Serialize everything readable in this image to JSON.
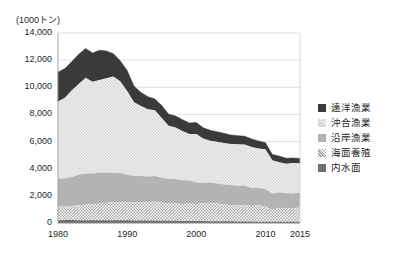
{
  "chart_data": {
    "type": "area",
    "title": "",
    "subtitle": "",
    "unit_label": "(1000トン)",
    "xlabel": "",
    "ylabel": "",
    "stacked": true,
    "grid": true,
    "legend_position": "right",
    "xlim": [
      1980,
      2015
    ],
    "ylim": [
      0,
      14000
    ],
    "ytick_labels": [
      "14,000",
      "12,000",
      "10,000",
      "8,000",
      "6,000",
      "4,000",
      "2,000",
      "0"
    ],
    "ytick_values": [
      14000,
      12000,
      10000,
      8000,
      6000,
      4000,
      2000,
      0
    ],
    "xtick_labels": [
      "1980",
      "1990",
      "2000",
      "2010",
      "2015"
    ],
    "xtick_values": [
      1980,
      1990,
      2000,
      2010,
      2015
    ],
    "x": [
      1980,
      1981,
      1982,
      1983,
      1984,
      1985,
      1986,
      1987,
      1988,
      1989,
      1990,
      1991,
      1992,
      1993,
      1994,
      1995,
      1996,
      1997,
      1998,
      1999,
      2000,
      2001,
      2002,
      2003,
      2004,
      2005,
      2006,
      2007,
      2008,
      2009,
      2010,
      2011,
      2012,
      2013,
      2014,
      2015
    ],
    "series": [
      {
        "name": "内水面",
        "pattern": "dark-gray-solid",
        "color": "#6b6b6b",
        "values": [
          210,
          215,
          215,
          210,
          205,
          205,
          205,
          205,
          200,
          200,
          200,
          190,
          185,
          180,
          175,
          170,
          165,
          160,
          155,
          150,
          145,
          140,
          135,
          130,
          125,
          120,
          115,
          110,
          105,
          100,
          95,
          90,
          90,
          90,
          90,
          90
        ]
      },
      {
        "name": "海面養殖",
        "pattern": "checker",
        "color": "#d4d4d4",
        "values": [
          990,
          1010,
          1030,
          1080,
          1150,
          1180,
          1220,
          1280,
          1320,
          1340,
          1350,
          1330,
          1330,
          1360,
          1400,
          1320,
          1300,
          1280,
          1250,
          1280,
          1260,
          1310,
          1350,
          1300,
          1230,
          1210,
          1180,
          1240,
          1150,
          1200,
          1110,
          900,
          1030,
          1000,
          990,
          1050
        ]
      },
      {
        "name": "沿岸漁業",
        "pattern": "medium-gray-solid",
        "color": "#b0b0b0",
        "values": [
          2040,
          2080,
          2150,
          2270,
          2280,
          2270,
          2270,
          2230,
          2180,
          2150,
          2000,
          1950,
          1940,
          1890,
          1890,
          1850,
          1800,
          1800,
          1740,
          1700,
          1580,
          1510,
          1500,
          1480,
          1480,
          1470,
          1430,
          1410,
          1320,
          1300,
          1290,
          1170,
          1120,
          1110,
          1090,
          1090
        ]
      },
      {
        "name": "沖合漁業",
        "pattern": "light-dotted",
        "color": "#e8e8e8",
        "values": [
          5705,
          5930,
          6380,
          6690,
          7060,
          6760,
          6850,
          6950,
          7090,
          6760,
          6180,
          5430,
          5170,
          4950,
          4850,
          4400,
          3910,
          3790,
          3630,
          3420,
          3570,
          3270,
          3070,
          3080,
          3060,
          3020,
          3070,
          3030,
          3020,
          2890,
          2940,
          2460,
          2230,
          2170,
          2250,
          2170
        ]
      },
      {
        "name": "遠洋漁業",
        "pattern": "dark-solid",
        "color": "#3a3a3a",
        "values": [
          2170,
          2150,
          2120,
          2180,
          2170,
          2110,
          2180,
          2000,
          1690,
          1500,
          1500,
          1180,
          1000,
          920,
          830,
          920,
          840,
          850,
          840,
          820,
          850,
          790,
          780,
          730,
          710,
          670,
          640,
          600,
          600,
          550,
          480,
          430,
          460,
          400,
          370,
          360
        ]
      }
    ]
  },
  "legend": {
    "items": [
      {
        "label": "遠洋漁業",
        "swatch": "dark-solid"
      },
      {
        "label": "沖合漁業",
        "swatch": "light-dotted"
      },
      {
        "label": "沿岸漁業",
        "swatch": "medium-gray-solid"
      },
      {
        "label": "海面養殖",
        "swatch": "checker"
      },
      {
        "label": "内水面",
        "swatch": "dark-gray-solid"
      }
    ]
  }
}
